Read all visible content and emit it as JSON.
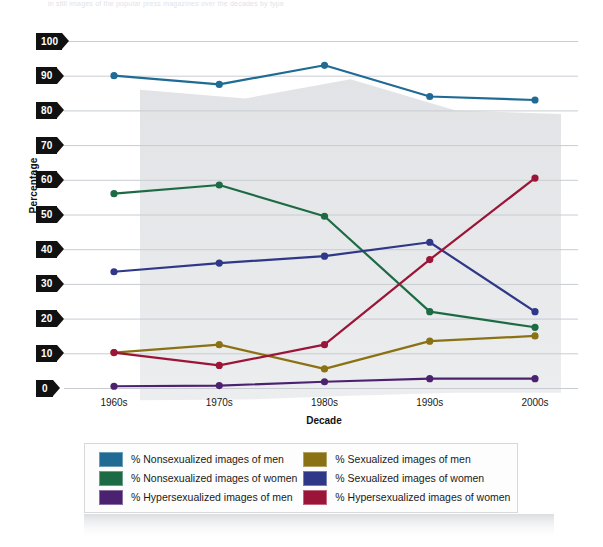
{
  "bleed_text": "in still images of the popular press magazines over the decades by type",
  "chart_data": {
    "type": "line",
    "title": "",
    "xlabel": "Decade",
    "ylabel": "Percentage",
    "ylim": [
      0,
      100
    ],
    "ytick_step": 10,
    "yticks": [
      "100",
      "90",
      "80",
      "70",
      "60",
      "50",
      "40",
      "30",
      "20",
      "10",
      "0"
    ],
    "categories": [
      "1960s",
      "1970s",
      "1980s",
      "1990s",
      "2000s"
    ],
    "grid": "horizontal",
    "legend_position": "bottom",
    "legend_columns": 2,
    "markers": "circle",
    "series": [
      {
        "name": "% Nonsexualized images of men",
        "color": "#1f6b94",
        "values": [
          90,
          87.5,
          93,
          84,
          83
        ]
      },
      {
        "name": "% Nonsexualized images of women",
        "color": "#1d6b45",
        "values": [
          56,
          58.5,
          49.5,
          22,
          17.5
        ]
      },
      {
        "name": "% Hypersexualized images of men",
        "color": "#4b2270",
        "values": [
          0.5,
          0.7,
          1.8,
          2.7,
          2.7
        ]
      },
      {
        "name": "% Sexualized images of men",
        "color": "#8a7113",
        "values": [
          10.2,
          12.5,
          5.5,
          13.5,
          15
        ]
      },
      {
        "name": "% Sexualized images of women",
        "color": "#2f3788",
        "values": [
          33.5,
          36,
          38,
          42,
          22
        ]
      },
      {
        "name": "% Hypersexualized images of women",
        "color": "#9b1538",
        "values": [
          10.2,
          6.5,
          12.5,
          37,
          60.5
        ]
      }
    ]
  },
  "legend": {
    "items": [
      {
        "label": "% Nonsexualized images of men",
        "color": "#1f6b94"
      },
      {
        "label": "% Sexualized images of men",
        "color": "#8a7113"
      },
      {
        "label": "% Nonsexualized images of women",
        "color": "#1d6b45"
      },
      {
        "label": "% Sexualized images of women",
        "color": "#2f3788"
      },
      {
        "label": "% Hypersexualized images of men",
        "color": "#4b2270"
      },
      {
        "label": "% Hypersexualized images of women",
        "color": "#9b1538"
      }
    ]
  }
}
